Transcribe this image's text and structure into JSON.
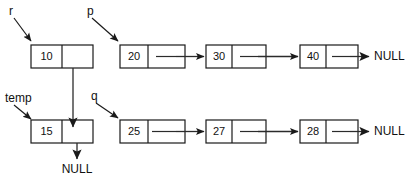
{
  "diagram": {
    "colors": {
      "background": "#ffffff",
      "stroke": "#1a1a1a",
      "link": "#2b2b2b",
      "text": "#111111"
    },
    "pointer_labels": [
      {
        "id": "r",
        "text": "r",
        "points_to": "10"
      },
      {
        "id": "p",
        "text": "p",
        "points_to": "20"
      },
      {
        "id": "temp",
        "text": "temp",
        "points_to": "15"
      },
      {
        "id": "q",
        "text": "q",
        "points_to": "25"
      }
    ],
    "lists": [
      {
        "id": "top-row",
        "nodes": [
          {
            "value": "10"
          },
          {
            "value": "20"
          },
          {
            "value": "30"
          },
          {
            "value": "40"
          }
        ],
        "terminator": "NULL"
      },
      {
        "id": "bottom-row",
        "nodes": [
          {
            "value": "15"
          },
          {
            "value": "25"
          },
          {
            "value": "27"
          },
          {
            "value": "28"
          }
        ],
        "terminator": "NULL"
      }
    ],
    "terminators": [
      {
        "id": "top-null",
        "text": "NULL"
      },
      {
        "id": "bottom-null",
        "text": "NULL"
      },
      {
        "id": "temp-null",
        "text": "NULL"
      }
    ],
    "nodes": {
      "n10": "10",
      "n20": "20",
      "n30": "30",
      "n40": "40",
      "n15": "15",
      "n25": "25",
      "n27": "27",
      "n28": "28"
    }
  }
}
